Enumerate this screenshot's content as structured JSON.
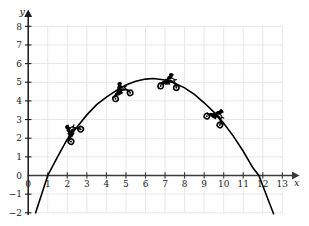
{
  "figure": {
    "title": "",
    "background_color": "#ffffff",
    "width": 309,
    "height": 226
  },
  "axes": {
    "x": {
      "name": "x",
      "ticks": [
        0,
        1,
        2,
        3,
        4,
        5,
        6,
        7,
        8,
        9,
        10,
        11,
        12,
        13
      ],
      "tick_labels": [
        "0",
        "1",
        "2",
        "3",
        "4",
        "5",
        "6",
        "7",
        "8",
        "9",
        "10",
        "11",
        "12",
        "13"
      ],
      "range": [
        -0.1,
        14.2
      ],
      "arrow": true,
      "color": "#3a3a3a"
    },
    "y": {
      "name": "y",
      "ticks": [
        -2,
        -1,
        0,
        1,
        2,
        3,
        4,
        5,
        6,
        7,
        8
      ],
      "tick_labels": [
        "−2",
        "−1",
        "0",
        "1",
        "2",
        "3",
        "4",
        "5",
        "6",
        "7",
        "8"
      ],
      "range": [
        -2.6,
        8.9
      ],
      "arrow": true,
      "color": "#1a1a1a"
    }
  },
  "grid": {
    "visible": true,
    "color": "#e4e4e6",
    "x_from": 0,
    "x_to": 13,
    "y_from": -2,
    "y_to": 8
  },
  "chart_data": {
    "type": "line",
    "title": "",
    "xlabel": "x",
    "ylabel": "y",
    "xlim": [
      -0.1,
      14.2
    ],
    "ylim": [
      -2.6,
      8.9
    ],
    "grid": true,
    "legend": "none",
    "curve": {
      "name": "projectile-parabola",
      "kind": "parabola",
      "color": "#000000",
      "equation": "y = -0.31(x - 6.4)^2 + 5.2",
      "vertex": [
        6.4,
        5.2
      ],
      "x_intercepts": [
        2.3,
        10.5
      ],
      "domain": [
        0.38,
        12.55
      ],
      "points": [
        [
          0.38,
          -2.0
        ],
        [
          1.0,
          0.0
        ],
        [
          1.5,
          1.0
        ],
        [
          2.0,
          1.95
        ],
        [
          2.5,
          2.6
        ],
        [
          3.0,
          3.25
        ],
        [
          3.5,
          3.8
        ],
        [
          4.0,
          4.2
        ],
        [
          4.5,
          4.55
        ],
        [
          5.0,
          4.85
        ],
        [
          5.5,
          5.05
        ],
        [
          6.0,
          5.17
        ],
        [
          6.4,
          5.2
        ],
        [
          7.0,
          5.12
        ],
        [
          7.5,
          4.95
        ],
        [
          8.0,
          4.7
        ],
        [
          8.5,
          4.35
        ],
        [
          9.0,
          3.9
        ],
        [
          9.5,
          3.4
        ],
        [
          10.0,
          2.8
        ],
        [
          10.5,
          2.1
        ],
        [
          11.0,
          1.3
        ],
        [
          11.5,
          0.4
        ],
        [
          11.8,
          0.0
        ],
        [
          12.0,
          -0.55
        ],
        [
          12.55,
          -2.05
        ]
      ]
    },
    "markers": [
      {
        "name": "motorcycle-1",
        "icon": "motorcycle-icon",
        "x": 2.25,
        "y": 2.3,
        "rotation": -52,
        "label": ""
      },
      {
        "name": "motorcycle-2",
        "icon": "motorcycle-icon",
        "x": 4.75,
        "y": 4.5,
        "rotation": -22,
        "label": ""
      },
      {
        "name": "motorcycle-3",
        "icon": "motorcycle-icon",
        "x": 7.2,
        "y": 5.0,
        "rotation": 6,
        "label": ""
      },
      {
        "name": "motorcycle-4",
        "icon": "motorcycle-icon",
        "x": 9.6,
        "y": 3.15,
        "rotation": 34,
        "label": ""
      }
    ]
  }
}
